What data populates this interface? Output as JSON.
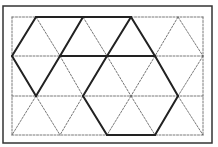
{
  "diagram": {
    "frame": {
      "x": 3,
      "y": 6,
      "w": 209,
      "h": 137,
      "color": "#333333"
    },
    "grid_rect": {
      "x": 12,
      "y": 17,
      "w": 191,
      "h": 118
    },
    "rows": [
      17,
      56,
      96,
      135
    ],
    "row_points": [
      [
        36,
        83,
        131,
        178
      ],
      [
        12,
        60,
        107,
        155,
        203
      ],
      [
        36,
        83,
        131,
        178
      ],
      [
        12,
        60,
        107,
        155,
        203
      ]
    ],
    "dashed_color": "#555555",
    "solid_color": "#222222",
    "solid_segments": [
      [
        36,
        17,
        131,
        17
      ],
      [
        36,
        17,
        12,
        56
      ],
      [
        12,
        56,
        36,
        96
      ],
      [
        36,
        96,
        60,
        56
      ],
      [
        60,
        56,
        83,
        17
      ],
      [
        60,
        56,
        155,
        56
      ],
      [
        107,
        56,
        131,
        17
      ],
      [
        131,
        17,
        155,
        56
      ],
      [
        107,
        56,
        83,
        96
      ],
      [
        155,
        56,
        178,
        96
      ],
      [
        83,
        96,
        107,
        135
      ],
      [
        107,
        135,
        155,
        135
      ],
      [
        155,
        135,
        178,
        96
      ]
    ]
  }
}
